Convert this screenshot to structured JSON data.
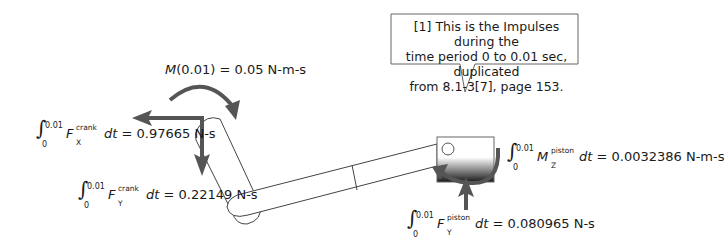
{
  "callout": {
    "text_line1": "[1] This is the Impulses during the",
    "text_line2": "time period 0 to 0.01 sec, duplicated",
    "text_line3": "from 8.1-3[7], page 153."
  },
  "moment_label": {
    "symbol": "M",
    "argument": "(0.01)",
    "value": "= 0.05 N-m-s"
  },
  "crank_fx": {
    "upper_limit": "0.01",
    "lower_limit": "0",
    "symbol": "F",
    "superscript": "crank",
    "subscript": "X",
    "dt": "dt",
    "value": "= 0.97665 N-s"
  },
  "crank_fy": {
    "upper_limit": "0.01",
    "lower_limit": "0",
    "symbol": "F",
    "superscript": "crank",
    "subscript": "Y",
    "dt": "dt",
    "value": "= 0.22149 N-s"
  },
  "piston_mz": {
    "upper_limit": "0.01",
    "lower_limit": "0",
    "symbol": "M",
    "superscript": "piston",
    "subscript": "Z",
    "dt": "dt",
    "value": "= 0.0032386 N-m-s"
  },
  "piston_fy": {
    "upper_limit": "0.01",
    "lower_limit": "0",
    "symbol": "F",
    "superscript": "piston",
    "subscript": "Y",
    "dt": "dt",
    "value": "= 0.080965 N-s"
  },
  "colors": {
    "arrow": "#555555",
    "outline": "#444444",
    "piston_dark": "#222222"
  }
}
